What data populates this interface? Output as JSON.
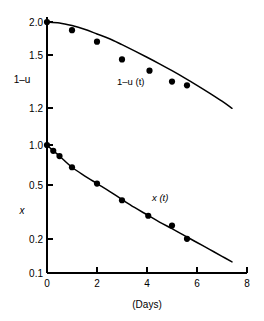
{
  "chart_data": {
    "type": "scatter",
    "title": "",
    "subtitle": "",
    "xlabel": "(Days)",
    "ylabel_upper": "1–u",
    "ylabel_lower": "x",
    "xlim": [
      0,
      8
    ],
    "x_ticks": [
      "0",
      "2",
      "4",
      "6",
      "8"
    ],
    "x_tick_values": [
      0,
      2,
      4,
      6,
      8
    ],
    "grid": false,
    "legend_position": "inline-annotation",
    "axes": [
      {
        "name": "upper",
        "scale": "log",
        "ylim": [
          1.0,
          2.0
        ],
        "y_ticks": [
          "2.0",
          "1.5",
          "1.2",
          "1.0"
        ],
        "y_tick_values": [
          2.0,
          1.5,
          1.2,
          1.0
        ],
        "label": "1–u"
      },
      {
        "name": "lower",
        "scale": "log",
        "ylim": [
          0.1,
          1.0
        ],
        "y_ticks": [
          "1.0",
          "0.5",
          "0.2",
          "0.1"
        ],
        "y_tick_values": [
          1.0,
          0.5,
          0.2,
          0.1
        ],
        "label": "x"
      }
    ],
    "series": [
      {
        "name": "1–u (t)",
        "annotation": "1–u (t)",
        "axis": "upper",
        "type": "scatter",
        "marker": "filled-circle",
        "x": [
          0.0,
          1.0,
          2.0,
          3.0,
          4.1,
          5.0,
          5.6
        ],
        "values": [
          2.0,
          1.91,
          1.79,
          1.62,
          1.52,
          1.43,
          1.4
        ]
      },
      {
        "name": "1–u (t) model curve",
        "axis": "upper",
        "type": "line",
        "x": [
          0.0,
          0.5,
          1.0,
          1.5,
          2.0,
          2.5,
          3.0,
          3.5,
          4.0,
          4.5,
          5.0,
          5.5,
          6.0,
          6.5,
          7.0,
          7.4
        ],
        "values": [
          2.0,
          1.99,
          1.96,
          1.92,
          1.87,
          1.82,
          1.76,
          1.7,
          1.64,
          1.58,
          1.52,
          1.46,
          1.4,
          1.34,
          1.28,
          1.23
        ]
      },
      {
        "name": "x (t)",
        "annotation": "x (t)",
        "axis": "lower",
        "type": "scatter",
        "marker": "filled-circle",
        "x": [
          0.0,
          0.25,
          0.5,
          1.0,
          2.0,
          3.0,
          4.05,
          5.0,
          5.6
        ],
        "values": [
          1.0,
          0.9,
          0.82,
          0.67,
          0.5,
          0.37,
          0.28,
          0.235,
          0.185
        ]
      },
      {
        "name": "x (t) model curve",
        "axis": "lower",
        "type": "line",
        "x": [
          0.0,
          0.25,
          0.5,
          1.0,
          1.5,
          2.0,
          2.5,
          3.0,
          3.5,
          4.0,
          4.5,
          5.0,
          5.5,
          6.0,
          6.5,
          7.0,
          7.4
        ],
        "values": [
          1.0,
          0.9,
          0.82,
          0.67,
          0.575,
          0.5,
          0.435,
          0.375,
          0.325,
          0.285,
          0.25,
          0.222,
          0.196,
          0.173,
          0.153,
          0.135,
          0.122
        ]
      }
    ]
  }
}
